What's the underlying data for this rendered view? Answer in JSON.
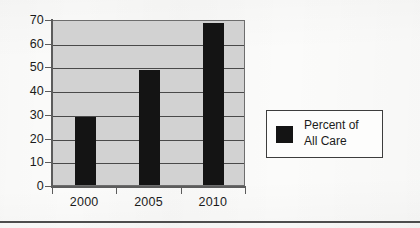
{
  "chart_data": {
    "type": "bar",
    "title": "",
    "subtitle": "",
    "xlabel": "",
    "ylabel": "",
    "categories": [
      "2000",
      "2005",
      "2010"
    ],
    "values": [
      28.5,
      48.5,
      68.5
    ],
    "series": [
      {
        "name": "Percent of All Care",
        "values": [
          28.5,
          48.5,
          68.5
        ],
        "color": "#141414"
      }
    ],
    "ylim": [
      0,
      70
    ],
    "ytick_labels": [
      "70",
      "60",
      "50",
      "40",
      "30",
      "20",
      "10",
      "0"
    ],
    "ytick_values": [
      70,
      60,
      50,
      40,
      30,
      20,
      10,
      0
    ],
    "xtick_labels": [
      "2000",
      "2005",
      "2010"
    ],
    "grid": true,
    "grid_axis": "y",
    "legend": {
      "position": "right",
      "entries": [
        {
          "label_line_1": "Percent of",
          "label_line_2": "All Care",
          "label": "Percent of All Care",
          "swatch_color": "#141414"
        }
      ]
    },
    "plot_background_color": "#d2d2d2",
    "gridline_color": "#4a4a4a",
    "axis_color": "#5c5c5c",
    "page_background_color": "#fbfbfa"
  },
  "figure": {
    "y_axis_name": "y-axis",
    "x_axis_name": "x-axis"
  }
}
